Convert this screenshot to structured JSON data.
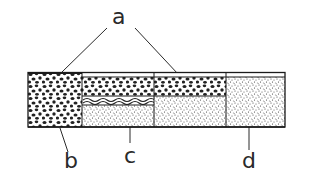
{
  "diagram": {
    "labels": {
      "a": "a",
      "b": "b",
      "c": "c",
      "d": "d"
    },
    "colors": {
      "ink": "#2a2a2a",
      "background": "#ffffff"
    }
  }
}
